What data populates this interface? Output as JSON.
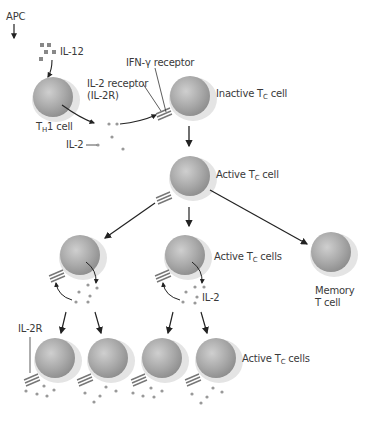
{
  "diagram": {
    "type": "flow",
    "title": "",
    "nodes": {
      "apc": {
        "label": "APC"
      },
      "il12": {
        "label": "IL-12"
      },
      "th1": {
        "label_main": "T",
        "label_sub": "H",
        "label_rest": "1 cell"
      },
      "il2_receptor": {
        "label_line1": "IL-2 receptor",
        "label_line2": "(IL-2R)"
      },
      "ifn_receptor": {
        "label": "IFN-γ receptor"
      },
      "il2": {
        "label": "IL-2"
      },
      "inactive_tc": {
        "label_pre": "Inactive T",
        "label_sub": "C",
        "label_post": " cell"
      },
      "active_tc": {
        "label_pre": "Active T",
        "label_sub": "C",
        "label_post": " cell"
      },
      "active_tc_cells_mid": {
        "label_pre": "Active T",
        "label_sub": "C",
        "label_post": " cells"
      },
      "il2_mid": {
        "label": "IL-2"
      },
      "memory": {
        "label_line1": "Memory",
        "label_line2": "T cell"
      },
      "il2r_bottom": {
        "label": "IL-2R"
      },
      "active_tc_cells_bottom": {
        "label_pre": "Active T",
        "label_sub": "C",
        "label_post": " cells"
      }
    },
    "edges": [
      {
        "from": "APC",
        "to": "IL-12"
      },
      {
        "from": "IL-12",
        "to": "TH1 cell"
      },
      {
        "from": "TH1 cell",
        "to": "IL-2"
      },
      {
        "from": "IL-2",
        "to": "IL-2 receptor on Inactive TC cell"
      },
      {
        "from": "Inactive TC cell",
        "to": "Active TC cell"
      },
      {
        "from": "Active TC cell",
        "to": "Active TC cells (left)"
      },
      {
        "from": "Active TC cell",
        "to": "Active TC cells (middle)"
      },
      {
        "from": "Active TC cell",
        "to": "Memory T cell"
      },
      {
        "from": "Active TC cells (left)",
        "to": "Active TC cells (bottom 1,2)"
      },
      {
        "from": "Active TC cells (middle)",
        "to": "Active TC cells (bottom 3,4)"
      }
    ]
  }
}
